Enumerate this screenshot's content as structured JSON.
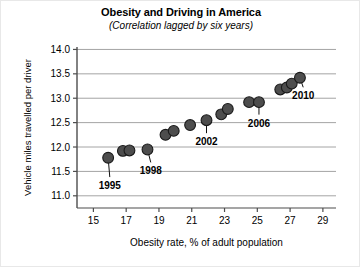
{
  "chart_data": {
    "type": "scatter",
    "title": "Obesity and Driving in America",
    "subtitle": "(Correlation lagged by six years)",
    "xlabel": "Obesity rate, % of adult population",
    "ylabel": "Vehicle miles travelled per driver",
    "xlim": [
      14.0,
      29.8
    ],
    "ylim": [
      10.75,
      14.05
    ],
    "xticks": [
      15,
      17,
      19,
      21,
      23,
      25,
      27,
      29
    ],
    "xticklabels": [
      "15",
      "17",
      "19",
      "21",
      "23",
      "25",
      "27",
      "29"
    ],
    "yticks": [
      11.0,
      11.5,
      12.0,
      12.5,
      13.0,
      13.5,
      14.0
    ],
    "yticklabels": [
      "11.0",
      "11.5",
      "12.0",
      "12.5",
      "13.0",
      "13.5",
      "14.0"
    ],
    "grid": "horizontal",
    "legend": "none",
    "marker_color": "#4d4d4d",
    "marker_edge_color": "#1a1a1a",
    "points": [
      {
        "label": "1995",
        "x": 15.9,
        "y": 11.78
      },
      {
        "label": "1996",
        "x": 16.8,
        "y": 11.92
      },
      {
        "label": "1997",
        "x": 17.2,
        "y": 11.93
      },
      {
        "label": "1998",
        "x": 18.3,
        "y": 11.95
      },
      {
        "label": "1999",
        "x": 19.4,
        "y": 12.25
      },
      {
        "label": "2000",
        "x": 19.9,
        "y": 12.33
      },
      {
        "label": "2001",
        "x": 20.9,
        "y": 12.45
      },
      {
        "label": "2002",
        "x": 21.9,
        "y": 12.55
      },
      {
        "label": "2003",
        "x": 22.8,
        "y": 12.67
      },
      {
        "label": "2004",
        "x": 23.2,
        "y": 12.78
      },
      {
        "label": "2005",
        "x": 24.5,
        "y": 12.92
      },
      {
        "label": "2006",
        "x": 25.1,
        "y": 12.92
      },
      {
        "label": "2007",
        "x": 26.4,
        "y": 13.18
      },
      {
        "label": "2008",
        "x": 26.8,
        "y": 13.22
      },
      {
        "label": "2009",
        "x": 27.1,
        "y": 13.3
      },
      {
        "label": "2010",
        "x": 27.6,
        "y": 13.42
      }
    ],
    "annotations": [
      {
        "text": "1995",
        "point_x": 15.9,
        "point_y": 11.78,
        "text_x": 16.0,
        "text_y": 11.22
      },
      {
        "text": "1998",
        "point_x": 18.3,
        "point_y": 11.95,
        "text_x": 18.5,
        "text_y": 11.52
      },
      {
        "text": "2002",
        "point_x": 21.9,
        "point_y": 12.55,
        "text_x": 21.9,
        "text_y": 12.12
      },
      {
        "text": "2006",
        "point_x": 25.1,
        "point_y": 12.92,
        "text_x": 25.1,
        "text_y": 12.5
      },
      {
        "text": "2010",
        "point_x": 27.6,
        "point_y": 13.42,
        "text_x": 27.8,
        "text_y": 13.06
      }
    ]
  }
}
